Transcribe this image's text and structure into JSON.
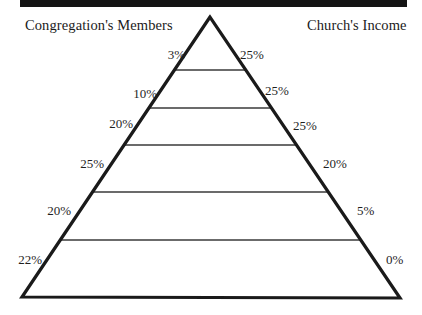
{
  "figure": {
    "headings": {
      "left": "Congregation's Members",
      "right": "Church's Income"
    },
    "colors": {
      "rule": "#141414",
      "outline": "#1a1a1a",
      "divider": "#3a3a3a",
      "text": "#1f1f1f",
      "background": "#ffffff"
    }
  },
  "chart_data": {
    "type": "bar",
    "title": "",
    "subtitle": "",
    "xlabel": "",
    "ylabel": "",
    "orientation": "pyramid",
    "shape": "triangle",
    "levels": 6,
    "grid": false,
    "legend_position": "top",
    "annotations": [
      "Congregation's Members",
      "Church's Income"
    ],
    "categories": [
      "Level 1 (apex)",
      "Level 2",
      "Level 3",
      "Level 4",
      "Level 5",
      "Level 6 (base)"
    ],
    "series": [
      {
        "name": "Congregation's Members",
        "side": "left",
        "unit": "%",
        "values": [
          3,
          10,
          20,
          25,
          20,
          22
        ],
        "labels": [
          "3%",
          "10%",
          "20%",
          "25%",
          "20%",
          "22%"
        ]
      },
      {
        "name": "Church's Income",
        "side": "right",
        "unit": "%",
        "values": [
          25,
          25,
          25,
          20,
          5,
          0
        ],
        "labels": [
          "25%",
          "25%",
          "25%",
          "20%",
          "5%",
          "0%"
        ]
      }
    ]
  },
  "geometry": {
    "apex": {
      "x": 210,
      "y": 17
    },
    "base_left": {
      "x": 22,
      "y": 297
    },
    "base_right": {
      "x": 400,
      "y": 298
    },
    "divider_y": [
      70,
      108,
      145,
      192,
      240
    ],
    "label_positions": {
      "left": [
        {
          "x": 185,
          "y": 47
        },
        {
          "x": 157,
          "y": 86
        },
        {
          "x": 133,
          "y": 116
        },
        {
          "x": 104,
          "y": 156
        },
        {
          "x": 71,
          "y": 203
        },
        {
          "x": 42,
          "y": 252
        }
      ],
      "right": [
        {
          "x": 240,
          "y": 47
        },
        {
          "x": 265,
          "y": 83
        },
        {
          "x": 293,
          "y": 118
        },
        {
          "x": 323,
          "y": 156
        },
        {
          "x": 357,
          "y": 203
        },
        {
          "x": 386,
          "y": 252
        }
      ]
    }
  }
}
